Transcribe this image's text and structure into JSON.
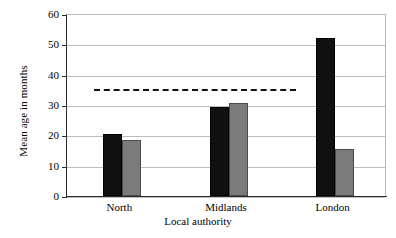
{
  "chart_data": {
    "type": "bar",
    "title": "",
    "xlabel": "Local authority",
    "ylabel": "Mean age in months",
    "categories": [
      "North",
      "Midlands",
      "London"
    ],
    "series": [
      {
        "name": "black-bars",
        "color": "#111111",
        "values": [
          20.5,
          29.5,
          52.0
        ]
      },
      {
        "name": "grey-bars",
        "color": "#7b7b7b",
        "values": [
          18.5,
          30.5,
          15.5
        ]
      }
    ],
    "ylim": [
      0,
      60
    ],
    "yticks": [
      0,
      10,
      20,
      30,
      40,
      50,
      60
    ],
    "ytick_labels": [
      "0",
      "10",
      "20",
      "30",
      "40",
      "50",
      "60"
    ],
    "grid": "horizontal",
    "legend": "none",
    "annotations": [
      {
        "name": "reference-line",
        "style": "dashed",
        "value": 35.5,
        "x_start_fraction": 0.085,
        "x_end_fraction": 0.715,
        "color": "#111111"
      }
    ]
  }
}
